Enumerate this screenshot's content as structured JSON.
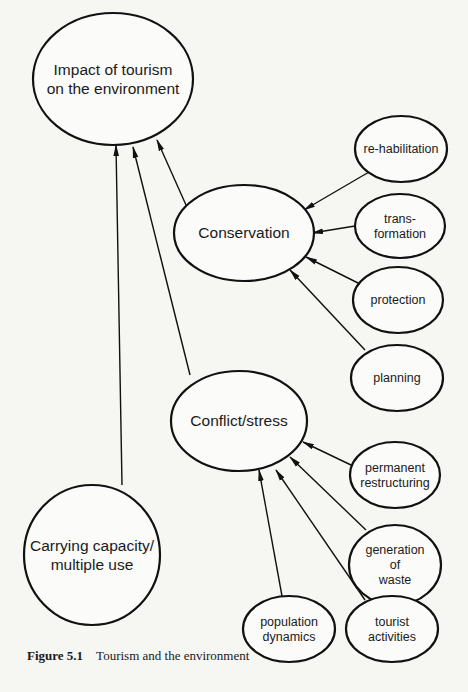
{
  "diagram": {
    "title": "Tourism and the environment",
    "nodes": [
      {
        "id": "impact",
        "lines": [
          "Impact of tourism",
          "on the environment"
        ],
        "cx": 113,
        "cy": 79,
        "rx": 80,
        "ry": 66,
        "font_size": 15.5
      },
      {
        "id": "conservation",
        "lines": [
          "Conservation"
        ],
        "cx": 244,
        "cy": 233,
        "rx": 70,
        "ry": 48,
        "font_size": 15.5
      },
      {
        "id": "conflict",
        "lines": [
          "Conflict/stress"
        ],
        "cx": 239,
        "cy": 421,
        "rx": 68,
        "ry": 50,
        "font_size": 15.5
      },
      {
        "id": "carrying",
        "lines": [
          "Carrying capacity/",
          "multiple use"
        ],
        "cx": 92,
        "cy": 555,
        "rx": 68,
        "ry": 70,
        "font_size": 15.5
      },
      {
        "id": "rehab",
        "lines": [
          "re-habilitation"
        ],
        "cx": 401,
        "cy": 149,
        "rx": 46,
        "ry": 33,
        "font_size": 12.5
      },
      {
        "id": "transform",
        "lines": [
          "trans-",
          "formation"
        ],
        "cx": 400,
        "cy": 226,
        "rx": 45,
        "ry": 32,
        "font_size": 12.5
      },
      {
        "id": "protection",
        "lines": [
          "protection"
        ],
        "cx": 398,
        "cy": 300,
        "rx": 45,
        "ry": 33,
        "font_size": 12.5
      },
      {
        "id": "planning",
        "lines": [
          "planning"
        ],
        "cx": 397,
        "cy": 378,
        "rx": 46,
        "ry": 33,
        "font_size": 12.5
      },
      {
        "id": "permanent",
        "lines": [
          "permanent",
          "restructuring"
        ],
        "cx": 395,
        "cy": 475,
        "rx": 45,
        "ry": 33,
        "font_size": 12.5
      },
      {
        "id": "waste",
        "lines": [
          "generation",
          "of",
          "waste"
        ],
        "cx": 395,
        "cy": 565,
        "rx": 46,
        "ry": 40,
        "font_size": 12.5
      },
      {
        "id": "population",
        "lines": [
          "population",
          "dynamics"
        ],
        "cx": 289,
        "cy": 629,
        "rx": 46,
        "ry": 33,
        "font_size": 12.5
      },
      {
        "id": "tourist",
        "lines": [
          "tourist",
          "activities"
        ],
        "cx": 392,
        "cy": 629,
        "rx": 46,
        "ry": 33,
        "font_size": 12.5
      }
    ],
    "edges": [
      {
        "from": "carrying",
        "to": "impact",
        "x1": 122,
        "y1": 485,
        "x2": 116,
        "y2": 145
      },
      {
        "from": "conflict",
        "to": "impact",
        "x1": 190,
        "y1": 375,
        "x2": 133,
        "y2": 147
      },
      {
        "from": "conservation",
        "to": "impact",
        "x1": 186,
        "y1": 205,
        "x2": 157,
        "y2": 140
      },
      {
        "from": "rehab",
        "to": "conservation",
        "x1": 369,
        "y1": 172,
        "x2": 304,
        "y2": 210
      },
      {
        "from": "transform",
        "to": "conservation",
        "x1": 355,
        "y1": 226,
        "x2": 312,
        "y2": 233
      },
      {
        "from": "protection",
        "to": "conservation",
        "x1": 360,
        "y1": 284,
        "x2": 306,
        "y2": 257
      },
      {
        "from": "planning",
        "to": "conservation",
        "x1": 365,
        "y1": 350,
        "x2": 290,
        "y2": 270
      },
      {
        "from": "permanent",
        "to": "conflict",
        "x1": 351,
        "y1": 465,
        "x2": 303,
        "y2": 442
      },
      {
        "from": "waste",
        "to": "conflict",
        "x1": 366,
        "y1": 530,
        "x2": 290,
        "y2": 457
      },
      {
        "from": "tourist",
        "to": "conflict",
        "x1": 365,
        "y1": 600,
        "x2": 276,
        "y2": 470
      },
      {
        "from": "population",
        "to": "conflict",
        "x1": 282,
        "y1": 596,
        "x2": 259,
        "y2": 470
      }
    ]
  },
  "caption": {
    "label": "Figure 5.1",
    "text": "Tourism and the environment"
  }
}
